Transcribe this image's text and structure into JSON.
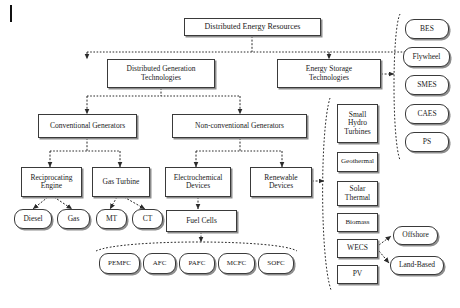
{
  "diagram": {
    "root": {
      "label": "Distributed Energy Resources"
    },
    "level2": [
      {
        "id": "dgt",
        "label": "Distributed Generation\nTechnologies"
      },
      {
        "id": "est",
        "label": "Energy Storage\nTechnologies"
      }
    ],
    "level3": [
      {
        "id": "conv",
        "label": "Conventional Generators"
      },
      {
        "id": "nonconv",
        "label": "Non-conventional Generators"
      }
    ],
    "level4": [
      {
        "id": "recip",
        "label": "Reciprocating\nEngine"
      },
      {
        "id": "gasturb",
        "label": "Gas Turbine"
      },
      {
        "id": "electro",
        "label": "Electrochemical\nDevices"
      },
      {
        "id": "renew",
        "label": "Renewable\nDevices"
      }
    ],
    "level5_pills": [
      {
        "id": "diesel",
        "label": "Diesel"
      },
      {
        "id": "gas",
        "label": "Gas"
      },
      {
        "id": "mt",
        "label": "MT"
      },
      {
        "id": "ct",
        "label": "CT"
      }
    ],
    "fuel_cells_box": {
      "label": "Fuel Cells"
    },
    "fuel_cell_types": [
      {
        "id": "pemfc",
        "label": "PEMFC"
      },
      {
        "id": "afc",
        "label": "AFC"
      },
      {
        "id": "pafc",
        "label": "PAFC"
      },
      {
        "id": "mcfc",
        "label": "MCFC"
      },
      {
        "id": "sofc",
        "label": "SOFC"
      }
    ],
    "storage_technologies": [
      {
        "id": "bes",
        "label": "BES"
      },
      {
        "id": "flywheel",
        "label": "Flywheel"
      },
      {
        "id": "smes",
        "label": "SMES"
      },
      {
        "id": "caes",
        "label": "CAES"
      },
      {
        "id": "ps",
        "label": "PS"
      }
    ],
    "renewable_technologies": [
      {
        "id": "smallhydro",
        "label": "Small\nHydro\nTurbines"
      },
      {
        "id": "geothermal",
        "label": "Geothermal"
      },
      {
        "id": "solarthermal",
        "label": "Solar\nThermal"
      },
      {
        "id": "biomass",
        "label": "Biomass"
      },
      {
        "id": "wecs",
        "label": "WECS"
      },
      {
        "id": "pv",
        "label": "PV"
      }
    ],
    "wecs_children": [
      {
        "id": "offshore",
        "label": "Offshore"
      },
      {
        "id": "landbased",
        "label": "Land-Based"
      }
    ],
    "colors": {
      "box_border": "#3a3a3a",
      "box_shadow": "#8d8d8d",
      "connector": "#2b2b2b",
      "background": "#ffffff",
      "text": "#1a1a1a"
    }
  }
}
